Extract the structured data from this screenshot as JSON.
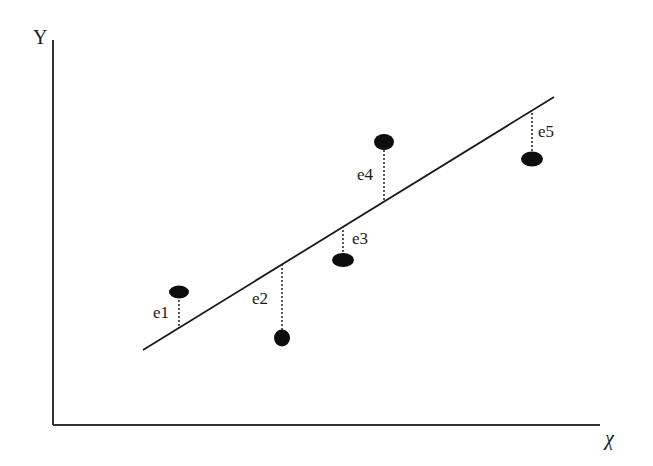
{
  "chart_data": {
    "type": "scatter",
    "title": "",
    "xlabel": "X",
    "ylabel": "Y",
    "grid": false,
    "legend": null,
    "regression_line": {
      "x1": 143,
      "y1": 350,
      "x2": 554,
      "y2": 97
    },
    "points": [
      {
        "label": "e1",
        "cx": 179,
        "cy": 292,
        "rx": 10,
        "ry": 6.5,
        "line_y": 328,
        "label_x": 153,
        "label_y": 318
      },
      {
        "label": "e2",
        "cx": 282,
        "cy": 338,
        "rx": 8,
        "ry": 8.5,
        "line_y": 265,
        "label_x": 252,
        "label_y": 304
      },
      {
        "label": "e3",
        "cx": 343,
        "cy": 260,
        "rx": 11,
        "ry": 7,
        "line_y": 227,
        "label_x": 352,
        "label_y": 244
      },
      {
        "label": "e4",
        "cx": 384,
        "cy": 142,
        "rx": 10,
        "ry": 8,
        "line_y": 200,
        "label_x": 357,
        "label_y": 180
      },
      {
        "label": "e5",
        "cx": 532,
        "cy": 159,
        "rx": 11,
        "ry": 7.5,
        "line_y": 110,
        "label_x": 538,
        "label_y": 137
      }
    ],
    "note": "Conceptual diagram of residuals (e1..e5) between observed points and fitted regression line; no numeric axes."
  },
  "axes": {
    "y_label": "Y",
    "x_label": "χ"
  },
  "colors": {
    "ink": "#1a1a1a",
    "background": "#ffffff"
  }
}
